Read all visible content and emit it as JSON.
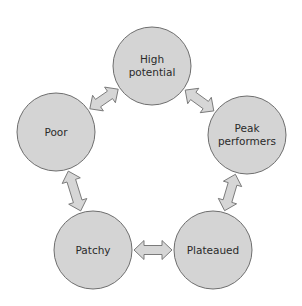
{
  "diagram": {
    "type": "cycle",
    "nodes": [
      {
        "id": "high",
        "lines": [
          "High",
          "potential"
        ]
      },
      {
        "id": "peak",
        "lines": [
          "Peak",
          "performers"
        ]
      },
      {
        "id": "plateaued",
        "lines": [
          "Plateaued"
        ]
      },
      {
        "id": "patchy",
        "lines": [
          "Patchy"
        ]
      },
      {
        "id": "poor",
        "lines": [
          "Poor"
        ]
      }
    ],
    "edges": [
      {
        "from": "high",
        "to": "peak",
        "style": "double-arrow"
      },
      {
        "from": "peak",
        "to": "plateaued",
        "style": "double-arrow"
      },
      {
        "from": "plateaued",
        "to": "patchy",
        "style": "double-arrow"
      },
      {
        "from": "patchy",
        "to": "poor",
        "style": "double-arrow"
      },
      {
        "from": "poor",
        "to": "high",
        "style": "double-arrow"
      }
    ]
  }
}
